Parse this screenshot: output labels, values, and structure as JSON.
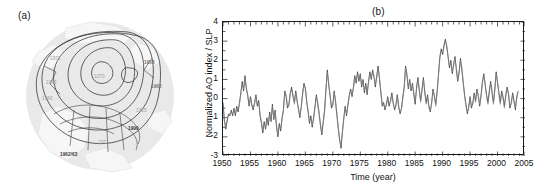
{
  "figure": {
    "panel_a": {
      "tag": "(a)",
      "type": "polar-stereographic-map",
      "description": "Northern Hemisphere polar map with sea-level-pressure contours and year annotations",
      "center_label": "1070",
      "annotations": [
        {
          "text": "1971",
          "x": 30,
          "y": 38,
          "style": "light"
        },
        {
          "text": "1956",
          "x": 26,
          "y": 62,
          "style": "light"
        },
        {
          "text": "1966",
          "x": 22,
          "y": 78,
          "style": "light"
        },
        {
          "text": "1958",
          "x": 124,
          "y": 42,
          "style": "mid"
        },
        {
          "text": "1962",
          "x": 131,
          "y": 66,
          "style": "mid"
        },
        {
          "text": "1955",
          "x": 116,
          "y": 90,
          "style": "light"
        },
        {
          "text": "1999",
          "x": 108,
          "y": 108,
          "style": "dark"
        },
        {
          "text": "1971",
          "x": 78,
          "y": 122,
          "style": "light"
        },
        {
          "text": "1962/63",
          "x": 40,
          "y": 134,
          "style": "dark"
        }
      ]
    },
    "panel_b": {
      "tag": "(b)"
    }
  },
  "chart_data": {
    "type": "line",
    "title": "",
    "xlabel": "Time (year)",
    "ylabel": "Normalized AO index / SLP",
    "xlim": [
      1950,
      2005
    ],
    "ylim": [
      -3,
      4
    ],
    "grid": false,
    "legend": "none",
    "xticks": [
      1950,
      1955,
      1960,
      1965,
      1970,
      1975,
      1980,
      1985,
      1990,
      1995,
      2000,
      2005
    ],
    "yticks": [
      4,
      3,
      2,
      1,
      0,
      -1,
      -2,
      -3
    ],
    "minor_tick_interval": 1,
    "series": [
      {
        "name": "Normalized AO index",
        "color": "#333333",
        "x_start": 1950.0,
        "x_step": 0.25,
        "values": [
          -0.2,
          -1.1,
          -1.6,
          -1.2,
          -0.8,
          -0.9,
          -0.6,
          -0.9,
          -0.5,
          -0.9,
          -0.4,
          -0.7,
          -0.2,
          0.3,
          0.9,
          0.4,
          1.2,
          0.5,
          0.2,
          -0.4,
          0.1,
          -0.3,
          -0.6,
          -0.2,
          0.2,
          -0.4,
          -0.1,
          -0.9,
          -1.3,
          -1.8,
          -1.2,
          -1.6,
          -1.0,
          -1.4,
          -0.7,
          -1.2,
          -0.3,
          -1.1,
          -0.6,
          -1.5,
          -2.0,
          -1.3,
          -1.7,
          -1.0,
          -0.6,
          0.4,
          0.1,
          -0.5,
          -0.3,
          0.3,
          0.6,
          0.1,
          -0.2,
          0.4,
          -0.1,
          -0.6,
          -1.0,
          -0.4,
          0.3,
          0.8,
          0.5,
          -0.2,
          -0.7,
          -1.3,
          -0.9,
          -1.5,
          -1.0,
          -0.4,
          0.2,
          -0.3,
          -0.8,
          -1.4,
          -1.9,
          -1.2,
          -0.6,
          0.5,
          1.5,
          0.7,
          0.2,
          -0.5,
          -0.3,
          0.4,
          -0.2,
          -0.9,
          -1.6,
          -2.2,
          -2.6,
          -1.7,
          -1.0,
          -0.4,
          -0.9,
          -0.3,
          0.2,
          0.5,
          0.1,
          0.6,
          1.2,
          0.8,
          1.4,
          0.9,
          1.3,
          0.6,
          1.0,
          0.3,
          0.8,
          0.2,
          0.9,
          1.4,
          1.0,
          1.5,
          1.1,
          0.6,
          1.2,
          1.7,
          1.0,
          0.3,
          -0.4,
          -0.2,
          -0.6,
          -0.3,
          0.1,
          -0.4,
          -0.1,
          0.3,
          -0.2,
          -0.6,
          -0.3,
          0.2,
          -0.4,
          -0.8,
          -0.5,
          0.1,
          0.6,
          1.7,
          1.2,
          0.5,
          1.0,
          0.4,
          0.8,
          0.2,
          -0.3,
          0.6,
          1.1,
          0.4,
          -0.1,
          0.5,
          1.1,
          0.3,
          -0.2,
          0.2,
          -0.4,
          -0.7,
          -0.2,
          0.5,
          0.1,
          -0.3,
          0.4,
          1.3,
          2.2,
          2.6,
          2.3,
          2.8,
          3.1,
          2.7,
          2.2,
          1.6,
          2.0,
          1.3,
          1.8,
          2.2,
          1.5,
          0.9,
          1.4,
          2.1,
          1.5,
          0.8,
          0.2,
          -0.3,
          -0.8,
          -0.4,
          0.1,
          -0.5,
          -0.2,
          0.3,
          -0.1,
          0.5,
          0.1,
          -0.4,
          0.2,
          0.9,
          1.3,
          0.7,
          0.2,
          -0.2,
          0.4,
          0.9,
          0.3,
          -0.2,
          0.5,
          1.4,
          0.8,
          0.3,
          -0.2,
          0.4,
          0.1,
          -0.4,
          0.2,
          0.6,
          0.2,
          -0.5,
          -0.2,
          0.3,
          -0.1,
          -0.6,
          0.1,
          0.4
        ]
      },
      {
        "name": "Normalized SLP",
        "color": "#808080",
        "x_start": 1950.0,
        "x_step": 0.25,
        "values": [
          -0.3,
          -1.2,
          -1.5,
          -1.1,
          -0.9,
          -0.8,
          -0.7,
          -0.8,
          -0.6,
          -0.8,
          -0.5,
          -0.6,
          -0.3,
          0.2,
          0.8,
          0.5,
          1.1,
          0.6,
          0.1,
          -0.3,
          0.0,
          -0.4,
          -0.5,
          -0.3,
          0.1,
          -0.3,
          -0.2,
          -0.8,
          -1.2,
          -1.7,
          -1.3,
          -1.5,
          -1.1,
          -1.3,
          -0.8,
          -1.1,
          -0.4,
          -1.0,
          -0.7,
          -1.4,
          -1.9,
          -1.4,
          -1.6,
          -1.1,
          -0.7,
          0.3,
          0.2,
          -0.4,
          -0.4,
          0.2,
          0.5,
          0.2,
          -0.3,
          0.3,
          -0.2,
          -0.5,
          -0.9,
          -0.5,
          0.2,
          0.7,
          0.6,
          -0.1,
          -0.6,
          -1.2,
          -1.0,
          -1.4,
          -1.1,
          -0.5,
          0.1,
          -0.2,
          -0.7,
          -1.3,
          -1.8,
          -1.3,
          -0.7,
          0.4,
          1.4,
          0.8,
          0.1,
          -0.4,
          -0.4,
          0.3,
          -0.1,
          -0.8,
          -1.5,
          -2.1,
          -2.5,
          -1.8,
          -1.1,
          -0.5,
          -0.8,
          -0.4,
          0.1,
          0.4,
          0.2,
          0.5,
          1.1,
          0.9,
          1.3,
          1.0,
          1.2,
          0.7,
          0.9,
          0.4,
          0.7,
          0.3,
          0.8,
          1.3,
          1.1,
          1.4,
          1.2,
          0.7,
          1.1,
          1.6,
          1.1,
          0.4,
          -0.3,
          -0.3,
          -0.5,
          -0.4,
          0.0,
          -0.3,
          -0.2,
          0.2,
          -0.3,
          -0.5,
          -0.4,
          0.1,
          -0.5,
          -0.7,
          -0.6,
          0.0,
          0.5,
          1.6,
          1.3,
          0.6,
          0.9,
          0.5,
          0.7,
          0.3,
          -0.2,
          0.5,
          1.0,
          0.5,
          -0.2,
          0.4,
          1.0,
          0.4,
          -0.3,
          0.1,
          -0.5,
          -0.6,
          -0.3,
          0.4,
          0.2,
          -0.4,
          0.3,
          1.2,
          2.1,
          2.5,
          2.4,
          2.7,
          3.0,
          2.8,
          2.1,
          1.7,
          1.9,
          1.4,
          1.7,
          2.1,
          1.6,
          1.0,
          1.3,
          2.0,
          1.6,
          0.9,
          0.1,
          -0.4,
          -0.7,
          -0.5,
          0.0,
          -0.4,
          -0.3,
          0.2,
          -0.2,
          0.4,
          0.2,
          -0.3,
          0.1,
          0.8,
          1.2,
          0.8,
          0.1,
          -0.3,
          0.3,
          0.8,
          0.4,
          -0.3,
          0.4,
          1.3,
          0.9,
          0.2,
          -0.3,
          0.3,
          0.0,
          -0.5,
          0.1,
          0.5,
          0.3,
          -0.4,
          -0.3,
          0.2,
          -0.2,
          -0.5,
          0.0,
          0.3
        ]
      }
    ]
  }
}
